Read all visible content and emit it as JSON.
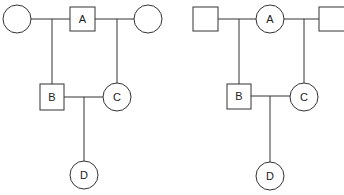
{
  "pedigrees": [
    {
      "id": "left",
      "individuals": {
        "A": {
          "label": "A",
          "shape": "square",
          "sex": "male"
        },
        "A_spouse_left": {
          "label": "",
          "shape": "circle",
          "sex": "female"
        },
        "A_spouse_right": {
          "label": "",
          "shape": "circle",
          "sex": "female"
        },
        "B": {
          "label": "B",
          "shape": "square",
          "sex": "male"
        },
        "C": {
          "label": "C",
          "shape": "circle",
          "sex": "female"
        },
        "D": {
          "label": "D",
          "shape": "circle",
          "sex": "female"
        }
      },
      "relations": [
        "B is child of A and left spouse",
        "C is child of A and right spouse",
        "D is child of B and C"
      ]
    },
    {
      "id": "right",
      "individuals": {
        "A": {
          "label": "A",
          "shape": "circle",
          "sex": "female"
        },
        "A_spouse_left": {
          "label": "",
          "shape": "square",
          "sex": "male"
        },
        "A_spouse_right": {
          "label": "",
          "shape": "square",
          "sex": "male"
        },
        "B": {
          "label": "B",
          "shape": "square",
          "sex": "male"
        },
        "C": {
          "label": "C",
          "shape": "circle",
          "sex": "female"
        },
        "D": {
          "label": "D",
          "shape": "circle",
          "sex": "female"
        }
      },
      "relations": [
        "B is child of left spouse and A",
        "C is child of A and right spouse",
        "D is child of B and C"
      ]
    }
  ],
  "colors": {
    "stroke": "#333333",
    "background": "#ffffff"
  }
}
